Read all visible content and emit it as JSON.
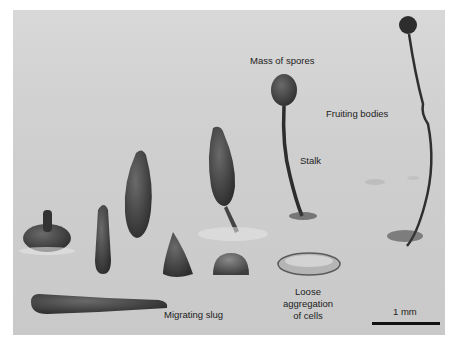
{
  "figure": {
    "top_text_cut": "(a) ... y",
    "labels": {
      "mass_of_spores": "Mass of spores",
      "fruiting_bodies": "Fruiting bodies",
      "stalk": "Stalk",
      "loose_aggregation_line1": "Loose",
      "loose_aggregation_line2": "aggregation",
      "loose_aggregation_line3": "of cells",
      "migrating_slug": "Migrating slug",
      "scale": "1 mm"
    },
    "colors": {
      "background": "#cfcfcf",
      "structures": "#3a3a3a",
      "scalebar": "#111111",
      "text": "#222222"
    }
  }
}
